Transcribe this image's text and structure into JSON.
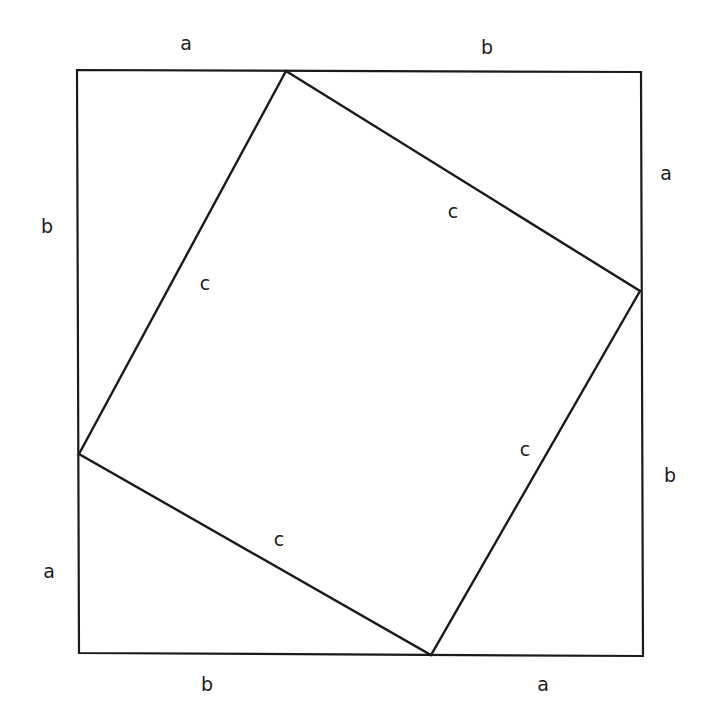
{
  "colors": {
    "stroke": "#1a1a1a",
    "background": "#ffffff"
  },
  "outer_square": {
    "corners": [
      [
        77,
        70
      ],
      [
        641,
        72
      ],
      [
        643,
        656
      ],
      [
        79,
        653
      ]
    ]
  },
  "inner_square": {
    "corners": [
      [
        286,
        71
      ],
      [
        640,
        291
      ],
      [
        431,
        655
      ],
      [
        79,
        454
      ]
    ]
  },
  "labels": [
    {
      "id": "top-a",
      "text": "a",
      "x": 186,
      "y": 43
    },
    {
      "id": "top-b",
      "text": "b",
      "x": 487,
      "y": 47
    },
    {
      "id": "right-a",
      "text": "a",
      "x": 666,
      "y": 173
    },
    {
      "id": "right-b",
      "text": "b",
      "x": 670,
      "y": 475
    },
    {
      "id": "bottom-b",
      "text": "b",
      "x": 207,
      "y": 684
    },
    {
      "id": "bottom-a",
      "text": "a",
      "x": 543,
      "y": 684
    },
    {
      "id": "left-b",
      "text": "b",
      "x": 47,
      "y": 226
    },
    {
      "id": "left-a",
      "text": "a",
      "x": 49,
      "y": 571
    },
    {
      "id": "c-upper-right",
      "text": "c",
      "x": 453,
      "y": 211
    },
    {
      "id": "c-left",
      "text": "c",
      "x": 205,
      "y": 283
    },
    {
      "id": "c-right",
      "text": "c",
      "x": 525,
      "y": 449
    },
    {
      "id": "c-lower",
      "text": "c",
      "x": 279,
      "y": 539
    }
  ]
}
